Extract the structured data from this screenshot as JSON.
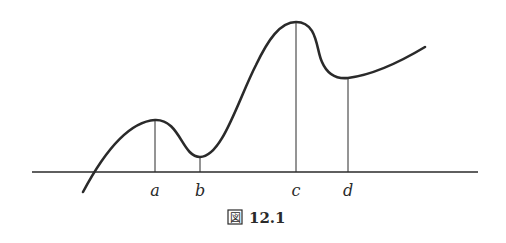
{
  "figure": {
    "caption_prefix_glyph": "図",
    "caption_number": "12.1",
    "points": [
      {
        "label": "a",
        "kind": "local-maximum"
      },
      {
        "label": "b",
        "kind": "local-minimum"
      },
      {
        "label": "c",
        "kind": "local-maximum"
      },
      {
        "label": "d",
        "kind": "local-minimum"
      }
    ]
  },
  "colors": {
    "ink": "#2a2a2a",
    "background": "#ffffff"
  }
}
